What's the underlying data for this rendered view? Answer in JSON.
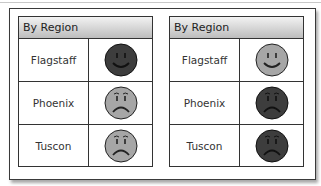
{
  "colors": {
    "happy_dark": "#3d3d3d",
    "happy_light": "#a6a6a6",
    "sad_light": "#a6a6a6",
    "sad_dark": "#3d3d3d"
  },
  "panels": [
    {
      "title": "By Region",
      "rows": [
        {
          "region": "Flagstaff",
          "face": "happy",
          "shade": "dark"
        },
        {
          "region": "Phoenix",
          "face": "sad",
          "shade": "light"
        },
        {
          "region": "Tuscon",
          "face": "sad",
          "shade": "light"
        }
      ]
    },
    {
      "title": "By Region",
      "rows": [
        {
          "region": "Flagstaff",
          "face": "happy",
          "shade": "light"
        },
        {
          "region": "Phoenix",
          "face": "sad",
          "shade": "dark"
        },
        {
          "region": "Tuscon",
          "face": "sad",
          "shade": "dark"
        }
      ]
    }
  ]
}
